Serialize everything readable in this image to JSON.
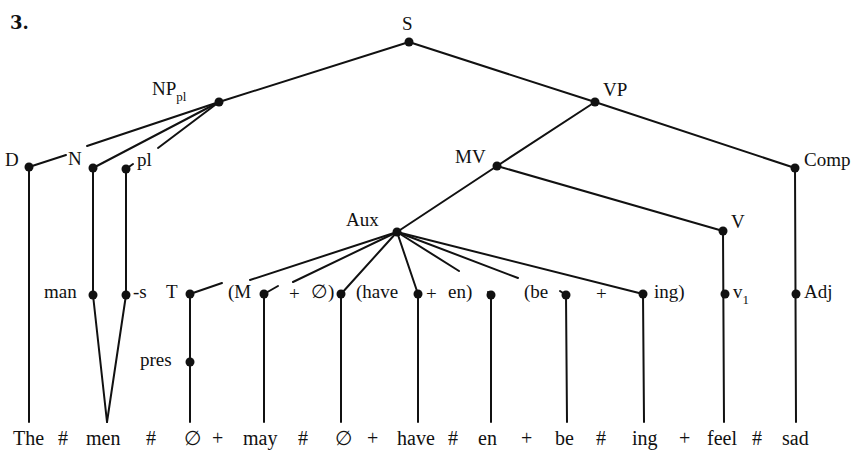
{
  "figure_number": "3.",
  "nodes": {
    "S": "S",
    "NP": "NP",
    "NP_sub": "pl",
    "VP": "VP",
    "D": "D",
    "N": "N",
    "pl": "pl",
    "MV": "MV",
    "Comp": "Comp",
    "Aux": "Aux",
    "V": "V",
    "man": "man",
    "s": "-s",
    "T": "T",
    "M": "(M",
    "plus1": "+",
    "null1": "∅)",
    "have": "(have",
    "plus2": "+",
    "en": "en)",
    "be": "(be",
    "plus3": "+",
    "ing": "ing)",
    "v": "v",
    "v_sub": "1",
    "Adj": "Adj",
    "pres": "pres"
  },
  "terminal_string": [
    "The",
    "#",
    "men",
    "#",
    "∅",
    "+",
    "may",
    "#",
    "∅",
    "+",
    "have",
    "#",
    "en",
    "+",
    "be",
    "#",
    "ing",
    "+",
    "feel",
    "#",
    "sad"
  ]
}
